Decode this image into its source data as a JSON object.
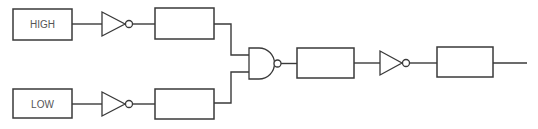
{
  "diagram": {
    "type": "logic-circuit",
    "colors": {
      "line": "#3a3a3a",
      "text": "#555555",
      "background": "#ffffff"
    },
    "inputs": [
      {
        "id": "in-high",
        "label": "HIGH"
      },
      {
        "id": "in-low",
        "label": "LOW"
      }
    ],
    "blocks": [
      {
        "id": "box-top",
        "label": ""
      },
      {
        "id": "box-bottom",
        "label": ""
      },
      {
        "id": "box-after-nand",
        "label": ""
      },
      {
        "id": "box-output",
        "label": ""
      }
    ],
    "gates": [
      {
        "id": "not-top",
        "type": "NOT"
      },
      {
        "id": "not-bottom",
        "type": "NOT"
      },
      {
        "id": "nand",
        "type": "NAND"
      },
      {
        "id": "not-final",
        "type": "NOT"
      }
    ],
    "connections": [
      [
        "in-high",
        "not-top"
      ],
      [
        "not-top",
        "box-top"
      ],
      [
        "box-top",
        "nand"
      ],
      [
        "in-low",
        "not-bottom"
      ],
      [
        "not-bottom",
        "box-bottom"
      ],
      [
        "box-bottom",
        "nand"
      ],
      [
        "nand",
        "box-after-nand"
      ],
      [
        "box-after-nand",
        "not-final"
      ],
      [
        "not-final",
        "box-output"
      ],
      [
        "box-output",
        "output"
      ]
    ]
  }
}
